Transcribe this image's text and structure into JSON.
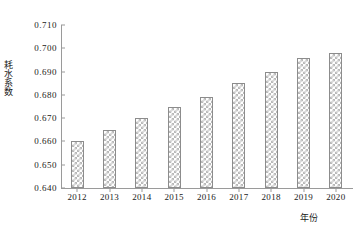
{
  "chart_data": {
    "type": "bar",
    "title": "",
    "subtitle": "",
    "xlabel": "年份",
    "ylabel": "耗水系数",
    "categories": [
      "2012",
      "2013",
      "2014",
      "2015",
      "2016",
      "2017",
      "2018",
      "2019",
      "2020"
    ],
    "values": [
      0.66,
      0.665,
      0.67,
      0.675,
      0.679,
      0.685,
      0.69,
      0.696,
      0.698
    ],
    "series": [
      {
        "name": "耗水系数",
        "values": [
          0.66,
          0.665,
          0.67,
          0.675,
          0.679,
          0.685,
          0.69,
          0.696,
          0.698
        ]
      }
    ],
    "ylim": [
      0.64,
      0.71
    ],
    "ytick_labels": [
      "0.710",
      "0.700",
      "0.690",
      "0.680",
      "0.670",
      "0.660",
      "0.650",
      "0.640"
    ],
    "ytick_values": [
      0.71,
      0.7,
      0.69,
      0.68,
      0.67,
      0.66,
      0.65,
      0.64
    ],
    "xtick_labels": [
      "2012",
      "2013",
      "2014",
      "2015",
      "2016",
      "2017",
      "2018",
      "2019",
      "2020"
    ],
    "grid": false,
    "legend": null,
    "legend_position": "none",
    "bar_fill": "#ffffff",
    "bar_pattern": "checkered-dot",
    "bar_edge_color": "#8c8c8c",
    "axis_color": "#9a9a9a",
    "background_color": "#ffffff",
    "annotations": []
  }
}
